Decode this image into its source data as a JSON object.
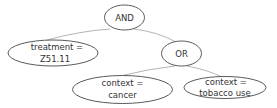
{
  "diagram": {
    "type": "tree",
    "colors": {
      "background": "#ffffff",
      "node_stroke": "#5a5a5a",
      "edge": "#b4b4b4",
      "text": "#333333"
    },
    "nodes": {
      "and": {
        "label": "AND"
      },
      "treatment": {
        "line1": "treatment =",
        "line2": "Z51.11"
      },
      "or": {
        "label": "OR"
      },
      "cancer": {
        "line1": "context =",
        "line2": "cancer"
      },
      "tobacco": {
        "line1": "context =",
        "line2": "tobacco use"
      }
    },
    "edges": [
      {
        "from": "AND",
        "to": "treatment = Z51.11"
      },
      {
        "from": "AND",
        "to": "OR"
      },
      {
        "from": "OR",
        "to": "context = cancer"
      },
      {
        "from": "OR",
        "to": "context = tobacco use"
      }
    ]
  }
}
